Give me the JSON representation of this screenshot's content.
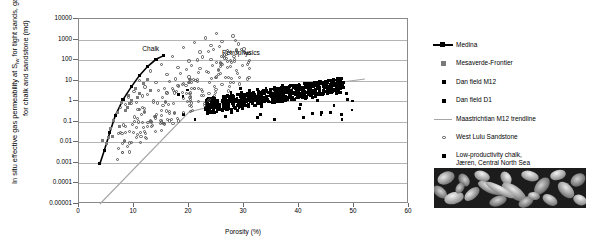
{
  "chart_data": {
    "type": "scatter",
    "title": "",
    "xlabel": "Porosity (%)",
    "ylabel_line1": "In situ effective gas permeability at S",
    "ylabel_sub": "iw",
    "ylabel_line2": " for tight sands,",
    "ylabel_line3": "gas permeability for chalk and sandstone (md)",
    "ylabel_full": "In situ effective gas permeability at Siw for tight sands, gas permeability for chalk and sandstone (md)",
    "xlim": [
      0,
      60
    ],
    "ylim": [
      1e-05,
      10000
    ],
    "yscale": "log",
    "xticks": [
      0,
      10,
      20,
      30,
      40,
      50,
      60
    ],
    "xtick_labels": [
      "0",
      "10",
      "20",
      "30",
      "40",
      "50",
      "60"
    ],
    "yticks": [
      10000,
      1000,
      100,
      10,
      1,
      0.1,
      0.01,
      0.001,
      0.0001,
      1e-05
    ],
    "ytick_labels": [
      "10000",
      "1000",
      "100",
      "10",
      "1",
      "0.1",
      "0.01",
      "0.001",
      "0.0001",
      "0.00001"
    ],
    "grid": "horizontal",
    "legend_position": "right",
    "annotations": [
      {
        "text": "Chalk",
        "x": 11.5,
        "y": 300
      },
      {
        "text": "Petrophysics",
        "x": 26.0,
        "y": 200
      }
    ],
    "series": [
      {
        "name": "Medina",
        "marker": "line-with-squares",
        "color": "#000000",
        "points": [
          [
            3.8,
            0.0009
          ],
          [
            4.6,
            0.004
          ],
          [
            5.6,
            0.03
          ],
          [
            6.6,
            0.2
          ],
          [
            8.0,
            1.2
          ],
          [
            9.5,
            5.0
          ],
          [
            11.0,
            18.0
          ],
          [
            12.5,
            50.0
          ],
          [
            14.0,
            110.0
          ],
          [
            15.3,
            160.0
          ]
        ]
      },
      {
        "name": "Mesaverde-Frontier",
        "marker": "square",
        "color": "#7a7a7a",
        "points": [
          [
            4.2,
            0.012
          ],
          [
            5.0,
            0.009
          ],
          [
            5.8,
            0.05
          ],
          [
            6.2,
            0.12
          ],
          [
            7.0,
            0.3
          ],
          [
            7.8,
            0.9
          ],
          [
            8.4,
            0.35
          ],
          [
            9.0,
            2.0
          ],
          [
            9.6,
            1.1
          ],
          [
            10.2,
            4.0
          ],
          [
            11.0,
            2.5
          ],
          [
            11.8,
            7.0
          ],
          [
            6.0,
            0.02
          ],
          [
            7.4,
            0.06
          ],
          [
            8.8,
            0.5
          ],
          [
            10.6,
            1.6
          ],
          [
            12.4,
            12.0
          ],
          [
            13.0,
            3.5
          ],
          [
            5.4,
            0.018
          ],
          [
            9.2,
            0.8
          ]
        ]
      },
      {
        "name": "Dan field M12",
        "marker": "square-small",
        "color": "#000000",
        "points": [
          [
            25.0,
            0.9
          ],
          [
            26.5,
            1.4
          ],
          [
            28.0,
            2.0
          ],
          [
            29.5,
            2.6
          ],
          [
            31.0,
            3.2
          ],
          [
            32.5,
            3.8
          ],
          [
            34.0,
            4.4
          ],
          [
            35.5,
            5.0
          ],
          [
            37.0,
            5.6
          ],
          [
            38.5,
            6.2
          ],
          [
            40.0,
            6.8
          ],
          [
            41.5,
            7.4
          ],
          [
            43.0,
            8.0
          ],
          [
            44.5,
            8.6
          ],
          [
            46.0,
            9.2
          ],
          [
            47.5,
            10.0
          ]
        ]
      },
      {
        "name": "Dan field D1",
        "marker": "square-small",
        "color": "#000000",
        "points": [
          [
            24.0,
            0.6
          ],
          [
            27.0,
            1.1
          ],
          [
            30.0,
            1.8
          ],
          [
            33.0,
            2.8
          ],
          [
            36.0,
            3.6
          ],
          [
            39.0,
            4.8
          ],
          [
            42.0,
            6.0
          ],
          [
            45.0,
            7.5
          ]
        ]
      },
      {
        "name": "Maastrichtian M12 trendline",
        "marker": "line",
        "color": "#a6a6a6",
        "points": [
          [
            3.8,
            1e-05
          ],
          [
            20.0,
            0.3
          ],
          [
            35.0,
            3.0
          ],
          [
            52.0,
            12.0
          ]
        ]
      },
      {
        "name": "West Lulu Sandstone",
        "marker": "circle-open",
        "color": "#555555",
        "points": [
          [
            10.0,
            3.0
          ],
          [
            11.0,
            10.0
          ],
          [
            12.0,
            5.0
          ],
          [
            13.0,
            30.0
          ],
          [
            14.0,
            8.0
          ],
          [
            15.0,
            60.0
          ],
          [
            16.0,
            20.0
          ],
          [
            17.0,
            150.0
          ],
          [
            18.0,
            45.0
          ],
          [
            19.0,
            400.0
          ],
          [
            20.0,
            90.0
          ],
          [
            21.0,
            700.0
          ],
          [
            22.0,
            250.0
          ],
          [
            23.0,
            1200.0
          ],
          [
            24.0,
            500.0
          ],
          [
            25.0,
            2000.0
          ],
          [
            26.0,
            800.0
          ],
          [
            27.0,
            300.0
          ],
          [
            28.0,
            1500.0
          ],
          [
            29.0,
            600.0
          ],
          [
            9.0,
            1.5
          ],
          [
            10.5,
            0.9
          ],
          [
            12.5,
            2.2
          ],
          [
            13.5,
            1.1
          ],
          [
            15.5,
            4.0
          ],
          [
            17.5,
            12.0
          ],
          [
            19.5,
            35.0
          ],
          [
            21.5,
            100.0
          ],
          [
            23.5,
            260.0
          ],
          [
            25.5,
            450.0
          ],
          [
            8.5,
            0.7
          ],
          [
            11.5,
            1.8
          ],
          [
            14.5,
            3.2
          ],
          [
            16.5,
            9.0
          ],
          [
            18.5,
            22.0
          ],
          [
            20.5,
            55.0
          ],
          [
            22.5,
            140.0
          ],
          [
            24.5,
            330.0
          ],
          [
            26.5,
            180.0
          ],
          [
            27.5,
            95.0
          ],
          [
            7.5,
            0.5
          ],
          [
            9.5,
            0.8
          ],
          [
            16.0,
            2.5
          ],
          [
            18.0,
            6.0
          ],
          [
            20.0,
            15.0
          ],
          [
            22.0,
            40.0
          ],
          [
            24.0,
            110.0
          ],
          [
            26.0,
            60.0
          ],
          [
            28.5,
            900.0
          ],
          [
            30.0,
            350.0
          ]
        ]
      },
      {
        "name": "Low-productivity chalk, Jären, Central North Sea",
        "marker": "square",
        "color": "#000000",
        "points": [
          [
            26.0,
            1.0
          ],
          [
            30.0,
            2.0
          ],
          [
            34.0,
            3.0
          ],
          [
            38.0,
            4.0
          ],
          [
            42.0,
            5.5
          ],
          [
            46.0,
            7.0
          ],
          [
            48.0,
            8.5
          ]
        ]
      }
    ]
  },
  "legend": {
    "items": [
      {
        "label": "Medina",
        "key": "line-with-square-marker"
      },
      {
        "label": "Mesaverde-Frontier",
        "key": "grey-square-marker"
      },
      {
        "label": "Dan field M12",
        "key": "black-square-marker"
      },
      {
        "label": "Dan field D1",
        "key": "black-square-marker"
      },
      {
        "label": "Maastrichtian M12 trendline",
        "key": "grey-line-marker"
      },
      {
        "label": "West Lulu Sandstone",
        "key": "open-circle-marker"
      },
      {
        "label": "Low-productivity chalk,\nJæren, Central North Sea",
        "key": "black-square-marker"
      }
    ]
  },
  "micrograph": {
    "caption": "",
    "alt": "SEM micrograph of low-productivity chalk"
  },
  "colors": {
    "axis": "#8a8a8a",
    "grid": "#b4b4b4",
    "medina_line": "#000000",
    "trendline": "#a6a6a6",
    "open_circle": "#555555",
    "filled_square": "#000000"
  }
}
